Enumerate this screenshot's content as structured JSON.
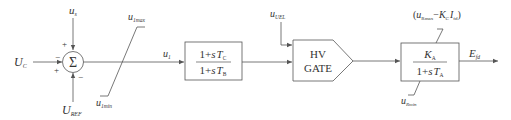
{
  "diagram": {
    "type": "control-block-diagram",
    "colors": {
      "line": "#555555",
      "text": "#333333",
      "background": "#ffffff"
    },
    "inputs": {
      "uc": {
        "main": "U",
        "sub": "C"
      },
      "us": {
        "main": "u",
        "sub": "s"
      },
      "uref": {
        "main": "U",
        "sub": "REF"
      },
      "uuel": {
        "main": "u",
        "sub": "UEL"
      }
    },
    "summing_junction": {
      "symbol": "Σ",
      "signs": {
        "top": "+",
        "left_upper": "−",
        "left_lower": "+",
        "bottom": "−"
      }
    },
    "limiter": {
      "max": {
        "main": "u",
        "sub": "1max"
      },
      "min": {
        "main": "u",
        "sub": "1min"
      }
    },
    "signal_u1": {
      "main": "u",
      "sub": "1"
    },
    "lead_lag_block": {
      "numerator": {
        "prefix": "1+",
        "s": "s",
        "T": "T",
        "sub": "C"
      },
      "denominator": {
        "prefix": "1+",
        "s": "s",
        "T": "T",
        "sub": "B"
      }
    },
    "hv_gate": {
      "line1": "HV",
      "line2": "GATE"
    },
    "exciter_block": {
      "numerator": {
        "main": "K",
        "sub": "A"
      },
      "denominator": {
        "prefix": "1+",
        "s": "s",
        "T": "T",
        "sub": "A"
      },
      "upper_limit": {
        "open": "(",
        "u": "u",
        "u_sub": "Rmax",
        "minus": "−",
        "K": "K",
        "K_sub": "C",
        "I": "I",
        "I_sub": "fd",
        "close": ")"
      },
      "lower_limit": {
        "main": "u",
        "sub": "Rmin"
      }
    },
    "output": {
      "main": "E",
      "sub": "fd"
    }
  }
}
